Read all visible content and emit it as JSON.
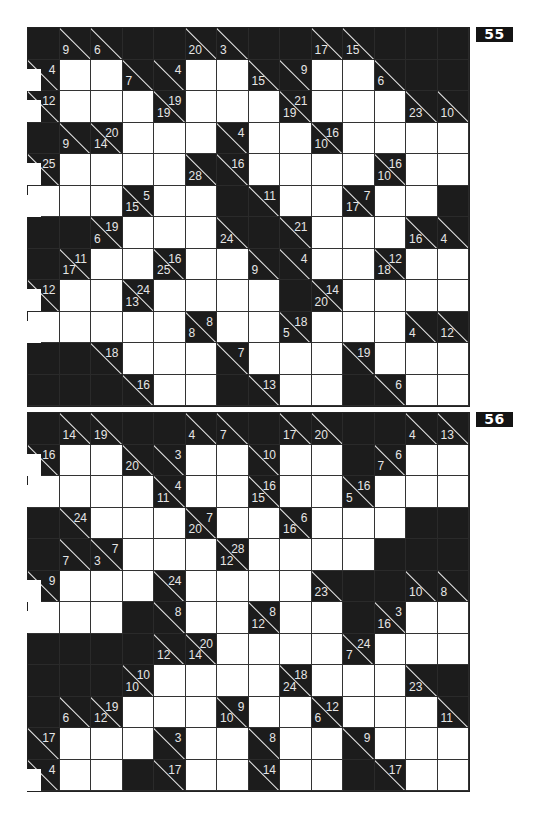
{
  "puzzles": [
    {
      "number": "55",
      "top": 27,
      "rows": [
        [
          "B",
          "c:9/",
          "c:6/",
          "B",
          "B",
          "c:20/",
          "c:3/",
          "B",
          "B",
          "c:17/",
          "c:15/",
          "B",
          "B",
          "B"
        ],
        [
          "c:/4",
          "W",
          "W",
          "c:7/",
          "c:/4",
          "W",
          "W",
          "c:15/",
          "c:/9",
          "W",
          "W",
          "c:6/",
          "B",
          "B"
        ],
        [
          "c:/12",
          "W",
          "W",
          "W",
          "c:19/19",
          "W",
          "W",
          "W",
          "c:19/21",
          "W",
          "W",
          "W",
          "c:23/",
          "c:10/"
        ],
        [
          "B",
          "c:9/",
          "c:14/20",
          "W",
          "W",
          "W",
          "c:/4",
          "W",
          "W",
          "c:10/16",
          "W",
          "W",
          "W",
          "W"
        ],
        [
          "c:/25",
          "W",
          "W",
          "W",
          "W",
          "c:28/",
          "c:/16",
          "W",
          "W",
          "W",
          "W",
          "c:10/16",
          "W",
          "W"
        ],
        [
          "W",
          "W",
          "W",
          "c:15/5",
          "W",
          "W",
          "B",
          "c:/11",
          "W",
          "W",
          "c:17/7",
          "W",
          "W",
          "B"
        ],
        [
          "B",
          "B",
          "c:6/19",
          "W",
          "W",
          "W",
          "c:24/",
          "B",
          "c:/21",
          "W",
          "W",
          "W",
          "c:16/",
          "c:4/"
        ],
        [
          "B",
          "c:17/11",
          "W",
          "W",
          "c:25/16",
          "W",
          "W",
          "c:9/",
          "c:/4",
          "W",
          "W",
          "c:18/12",
          "W",
          "W"
        ],
        [
          "c:/12",
          "W",
          "W",
          "c:13/24",
          "W",
          "W",
          "W",
          "W",
          "B",
          "c:20/14",
          "W",
          "W",
          "W",
          "W"
        ],
        [
          "W",
          "W",
          "W",
          "W",
          "W",
          "c:8/8",
          "W",
          "W",
          "c:5/18",
          "W",
          "W",
          "W",
          "c:4/",
          "c:12/"
        ],
        [
          "B",
          "B",
          "c:/18",
          "W",
          "W",
          "W",
          "c:/7",
          "W",
          "W",
          "W",
          "c:/19",
          "W",
          "W",
          "W"
        ],
        [
          "B",
          "B",
          "B",
          "c:/16",
          "W",
          "W",
          "B",
          "c:/13",
          "W",
          "W",
          "B",
          "c:/6",
          "W",
          "W"
        ]
      ],
      "left_covers": [
        {
          "row": 1,
          "note": "white tab over clue cell"
        },
        {
          "row": 2,
          "note": "white tab over clue cell"
        },
        {
          "row": 4,
          "note": "white tab over clue cell"
        },
        {
          "row": 5,
          "note": "white tab"
        },
        {
          "row": 8,
          "note": "white tab"
        },
        {
          "row": 9,
          "note": "white tab"
        }
      ]
    },
    {
      "number": "56",
      "top": 412,
      "rows": [
        [
          "B",
          "c:14/",
          "c:19/",
          "B",
          "B",
          "c:4/",
          "c:7/",
          "B",
          "c:17/",
          "c:20/",
          "B",
          "B",
          "c:4/",
          "c:13/"
        ],
        [
          "c:/16",
          "W",
          "W",
          "c:20/",
          "c:/3",
          "W",
          "W",
          "c:/10",
          "W",
          "W",
          "B",
          "c:7/6",
          "W",
          "W"
        ],
        [
          "W",
          "W",
          "W",
          "W",
          "c:11/4",
          "W",
          "W",
          "c:15/16",
          "W",
          "W",
          "c:5/16",
          "W",
          "W",
          "W"
        ],
        [
          "B",
          "c:/24",
          "W",
          "W",
          "W",
          "c:20/7",
          "W",
          "W",
          "c:16/6",
          "W",
          "W",
          "W",
          "B",
          "B"
        ],
        [
          "B",
          "c:7/",
          "c:3/7",
          "W",
          "W",
          "W",
          "c:12/28",
          "W",
          "W",
          "W",
          "W",
          "B",
          "B",
          "B"
        ],
        [
          "c:/9",
          "W",
          "W",
          "W",
          "c:/24",
          "W",
          "W",
          "W",
          "W",
          "c:23/",
          "B",
          "B",
          "c:10/",
          "c:8/"
        ],
        [
          "W",
          "W",
          "W",
          "B",
          "c:/8",
          "W",
          "W",
          "c:12/8",
          "W",
          "W",
          "B",
          "c:16/3",
          "W",
          "W"
        ],
        [
          "B",
          "B",
          "B",
          "B",
          "c:12/",
          "c:14/20",
          "W",
          "W",
          "W",
          "W",
          "c:7/24",
          "W",
          "W",
          "W"
        ],
        [
          "B",
          "B",
          "B",
          "c:10/10",
          "W",
          "W",
          "W",
          "W",
          "c:24/18",
          "W",
          "W",
          "W",
          "c:23/",
          "B"
        ],
        [
          "B",
          "c:6/",
          "c:12/19",
          "W",
          "W",
          "W",
          "c:10/9",
          "W",
          "W",
          "c:6/12",
          "W",
          "W",
          "W",
          "c:11/"
        ],
        [
          "c:/17",
          "W",
          "W",
          "W",
          "c:/3",
          "W",
          "W",
          "c:/8",
          "W",
          "W",
          "c:/9",
          "W",
          "W",
          "W"
        ],
        [
          "c:/4",
          "W",
          "W",
          "B",
          "c:/17",
          "W",
          "W",
          "c:/14",
          "W",
          "W",
          "B",
          "c:/17",
          "W",
          "W"
        ]
      ],
      "left_covers": [
        {
          "row": 1,
          "note": "white tab"
        },
        {
          "row": 2,
          "note": "white tab"
        },
        {
          "row": 5,
          "note": "white tab"
        },
        {
          "row": 6,
          "note": "white tab"
        },
        {
          "row": 11,
          "note": "white tab over clue cell"
        }
      ]
    }
  ],
  "colors": {
    "black_cell": "#1c1c1c",
    "white_cell": "#ffffff",
    "clue_text": "#e6e6e6",
    "badge_bg": "#141414"
  }
}
